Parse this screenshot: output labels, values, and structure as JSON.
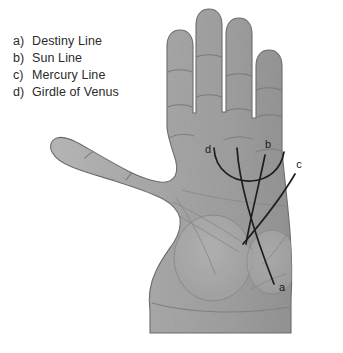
{
  "figure": {
    "background_color": "#ffffff"
  },
  "legend": {
    "items": [
      {
        "key": "a)",
        "label": "Destiny Line"
      },
      {
        "key": "b)",
        "label": "Sun Line"
      },
      {
        "key": "c)",
        "label": "Mercury Line"
      },
      {
        "key": "d)",
        "label": "Girdle of Venus"
      }
    ]
  },
  "callouts": [
    {
      "id": "a",
      "letter": "a",
      "refers_to": "Destiny Line",
      "x": 282,
      "y": 291
    },
    {
      "id": "b",
      "letter": "b",
      "refers_to": "Sun Line",
      "x": 268,
      "y": 148
    },
    {
      "id": "c",
      "letter": "c",
      "refers_to": "Mercury Line",
      "x": 299,
      "y": 168
    },
    {
      "id": "d",
      "letter": "d",
      "refers_to": "Girdle of Venus",
      "x": 208,
      "y": 153
    }
  ],
  "colors": {
    "skin_light": "#b4b4b4",
    "skin_mid": "#a6a6a6",
    "skin_dark": "#959595",
    "outline": "#6f6f6f",
    "crease": "#7a7a7a",
    "marked_line": "#1e1e1e",
    "text": "#2b2b2b"
  },
  "anatomy": {
    "fingers": [
      "index",
      "middle",
      "ring",
      "little"
    ],
    "thumb": "thumb",
    "palm_mounts": [
      "mount-of-venus",
      "mount-of-luna"
    ],
    "wrist": "wrist"
  }
}
